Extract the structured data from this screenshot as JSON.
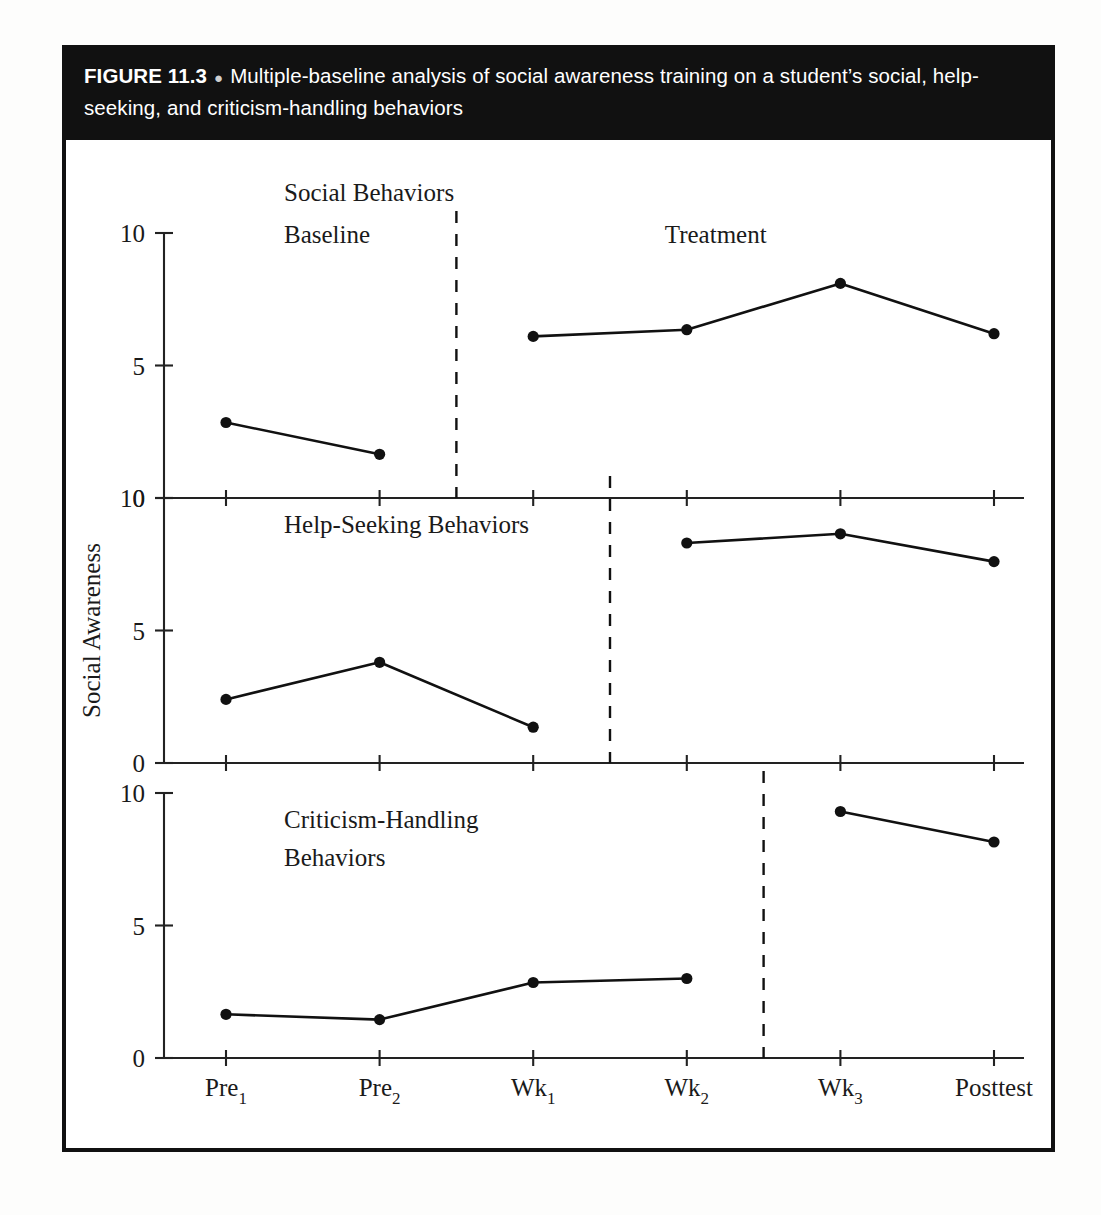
{
  "caption": {
    "figure_number": "FIGURE 11.3",
    "bullet": "●",
    "text": "Multiple-baseline analysis of social awareness training on a student’s social, help-seeking, and criticism-handling behaviors"
  },
  "colors": {
    "caption_bar_background": "#111111",
    "caption_text": "#ffffff",
    "frame_border": "#111111",
    "plot_background": "#ffffff",
    "ink": "#111111",
    "axis": "#222222"
  },
  "chart_data": {
    "type": "line",
    "title": "Multiple-baseline analysis of social awareness training on a student’s social, help-seeking, and criticism-handling behaviors",
    "xlabel": "",
    "ylabel": "Social Awareness",
    "ylim": [
      0,
      10
    ],
    "yticks": [
      0,
      5,
      10
    ],
    "ytick_labels": [
      "0",
      "5",
      "10"
    ],
    "grid": false,
    "legend": "none",
    "x": [
      "Pre1",
      "Pre2",
      "Wk1",
      "Wk2",
      "Wk3",
      "Posttest"
    ],
    "x_tick_labels": [
      {
        "base": "Pre",
        "sub": "1"
      },
      {
        "base": "Pre",
        "sub": "2"
      },
      {
        "base": "Wk",
        "sub": "1"
      },
      {
        "base": "Wk",
        "sub": "2"
      },
      {
        "base": "Wk",
        "sub": "3"
      },
      {
        "base": "Posttest",
        "sub": ""
      }
    ],
    "phase_labels": [
      "Baseline",
      "Treatment"
    ],
    "panels": [
      {
        "name": "social-behaviors",
        "title": "Social Behaviors",
        "intervention_after_index": 1,
        "show_phase_labels": true,
        "baseline": {
          "x": [
            "Pre1",
            "Pre2"
          ],
          "values": [
            2.85,
            1.65
          ]
        },
        "treatment": {
          "x": [
            "Wk1",
            "Wk2",
            "Wk3",
            "Posttest"
          ],
          "values": [
            6.1,
            6.35,
            8.1,
            6.2
          ]
        }
      },
      {
        "name": "help-seeking-behaviors",
        "title": "Help-Seeking Behaviors",
        "intervention_after_index": 2,
        "show_phase_labels": false,
        "baseline": {
          "x": [
            "Pre1",
            "Pre2",
            "Wk1"
          ],
          "values": [
            2.4,
            3.8,
            1.35
          ]
        },
        "treatment": {
          "x": [
            "Wk2",
            "Wk3",
            "Posttest"
          ],
          "values": [
            8.3,
            8.65,
            7.6
          ]
        }
      },
      {
        "name": "criticism-handling-behaviors",
        "title": "Criticism-Handling Behaviors",
        "title_line1": "Criticism-Handling",
        "title_line2": "Behaviors",
        "intervention_after_index": 3,
        "show_phase_labels": false,
        "baseline": {
          "x": [
            "Pre1",
            "Pre2",
            "Wk1",
            "Wk2"
          ],
          "values": [
            1.65,
            1.45,
            2.85,
            3.0
          ]
        },
        "treatment": {
          "x": [
            "Wk3",
            "Posttest"
          ],
          "values": [
            9.3,
            8.15
          ]
        }
      }
    ]
  }
}
